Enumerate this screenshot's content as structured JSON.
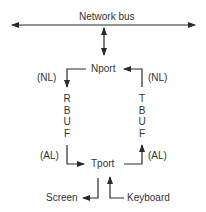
{
  "diagram": {
    "bus_label": "Network bus",
    "nport_label": "Nport",
    "tport_label": "Tport",
    "left_top_annotation": "(NL)",
    "right_top_annotation": "(NL)",
    "left_bottom_annotation": "(AL)",
    "right_bottom_annotation": "(AL)",
    "rbuf_letters": [
      "R",
      "B",
      "U",
      "F"
    ],
    "tbuf_letters": [
      "T",
      "B",
      "U",
      "F"
    ],
    "screen_label": "Screen",
    "keyboard_label": "Keyboard",
    "line_color": "#2a2a2a"
  }
}
